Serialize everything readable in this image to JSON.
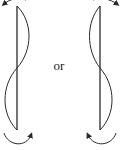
{
  "diagram": {
    "connector_label": "or",
    "colors": {
      "stroke": "#2a2a2a",
      "background": "#ffffff"
    },
    "figures": [
      {
        "id": "left",
        "description": "vertical rod with S-shaped wave, bulging right at top and left at bottom; rotation arrows at top (counter-clockwise) and bottom (clockwise toward right)",
        "rod_x": 17,
        "rod_y": [
          6,
          130
        ]
      },
      {
        "id": "right",
        "description": "mirror-image vertical rod with S-shaped wave, bulging left at top and right at bottom; rotation arrows at top and bottom pointing toward left",
        "rod_x": 100,
        "rod_y": [
          6,
          130
        ]
      }
    ]
  }
}
